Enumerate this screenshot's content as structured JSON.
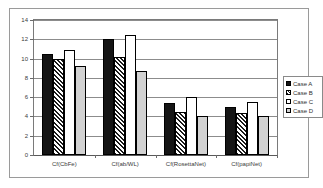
{
  "chart_data": {
    "type": "bar",
    "title": "",
    "subtitle": "",
    "xlabel": "",
    "ylabel": "",
    "ylim": [
      0,
      14
    ],
    "ytick_step": 2,
    "yticks": [
      "0",
      "2",
      "4",
      "6",
      "8",
      "10",
      "12",
      "14"
    ],
    "grid": true,
    "legend_position": "right",
    "categories": [
      "Cf(CbFe)",
      "Cf(ab/WL)",
      "Cf(RosettaNet)",
      "Cf(papiNet)"
    ],
    "series": [
      {
        "name": "Case A",
        "fill": "solid-black",
        "values": [
          10.5,
          12.0,
          5.4,
          5.0
        ]
      },
      {
        "name": "Case B",
        "fill": "diagonal-hatch",
        "values": [
          10.0,
          10.2,
          4.5,
          4.4
        ]
      },
      {
        "name": "Case C",
        "fill": "white-outline",
        "values": [
          10.9,
          12.4,
          6.0,
          5.5
        ]
      },
      {
        "name": "Case D",
        "fill": "grey-stipple",
        "values": [
          9.2,
          8.7,
          4.0,
          4.0
        ]
      }
    ]
  },
  "legend": {
    "items": [
      {
        "label": "Case A"
      },
      {
        "label": "Case B"
      },
      {
        "label": "Case C"
      },
      {
        "label": "Case D"
      }
    ]
  },
  "colors": {
    "plot_background": "#ffffff",
    "frame_border": "#9a9a9a",
    "axis": "#5a5a5a",
    "gridline": "#8c8c8c",
    "series_a": "#151515",
    "series_b": "#1a1a1a",
    "series_c": "#ffffff",
    "series_d": "#d2d2d2",
    "text": "#3a3a3a"
  }
}
